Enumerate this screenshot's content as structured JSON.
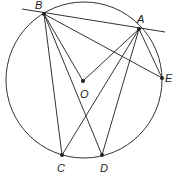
{
  "figure": {
    "type": "circle-geometry",
    "circle": {
      "cx": 84,
      "cy": 80,
      "r": 78,
      "stroke": "#333333"
    },
    "points": [
      {
        "id": "B",
        "x": 44,
        "y": 14,
        "label": "B",
        "lx": 35,
        "ly": 9
      },
      {
        "id": "A",
        "x": 139,
        "y": 29,
        "label": "A",
        "lx": 137,
        "ly": 23
      },
      {
        "id": "E",
        "x": 162,
        "y": 78,
        "label": "E",
        "lx": 165,
        "ly": 82
      },
      {
        "id": "O",
        "x": 83,
        "y": 81,
        "label": "O",
        "lx": 80,
        "ly": 98
      },
      {
        "id": "C",
        "x": 62,
        "y": 155,
        "label": "C",
        "lx": 57,
        "ly": 172
      },
      {
        "id": "D",
        "x": 102,
        "y": 155,
        "label": "D",
        "lx": 100,
        "ly": 172
      }
    ],
    "segments": [
      {
        "from": [
          22,
          9
        ],
        "to": [
          165,
          32
        ],
        "name": "tangent-line-at-A"
      },
      {
        "from": "B",
        "to": "O"
      },
      {
        "from": "O",
        "to": "A"
      },
      {
        "from": "B",
        "to": "C"
      },
      {
        "from": "B",
        "to": "D"
      },
      {
        "from": "B",
        "to": "E"
      },
      {
        "from": "A",
        "to": "C"
      },
      {
        "from": "A",
        "to": "D"
      },
      {
        "from": "A",
        "to": "E"
      }
    ],
    "labels": {
      "B": "B",
      "A": "A",
      "E": "E",
      "O": "O",
      "C": "C",
      "D": "D"
    }
  }
}
